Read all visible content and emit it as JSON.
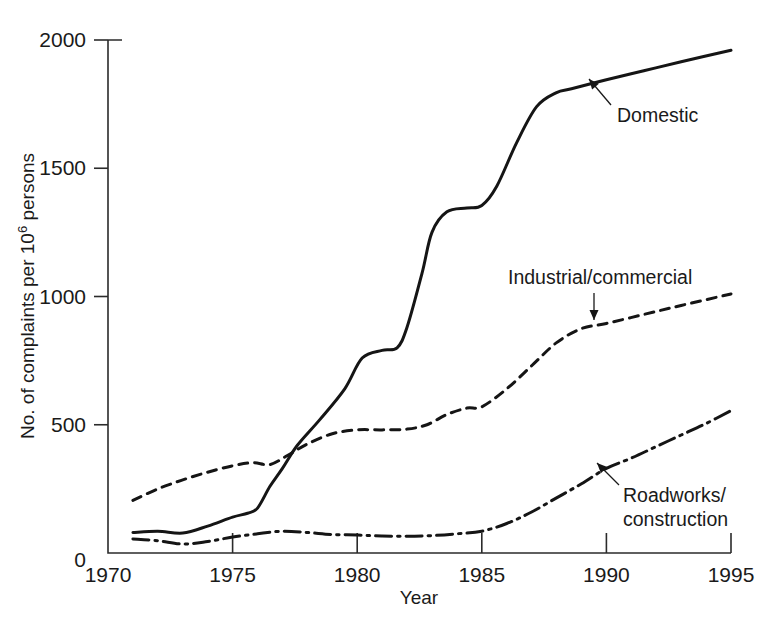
{
  "chart_data": {
    "type": "line",
    "title": "",
    "xlabel": "Year",
    "ylabel": "No. of complaints per 10^6 persons",
    "ylabel_prefix": "No. of complaints per 10",
    "ylabel_exponent": "6",
    "ylabel_suffix": " persons",
    "xlim": [
      1970,
      1995
    ],
    "ylim": [
      0,
      2000
    ],
    "xticks": [
      1970,
      1975,
      1980,
      1985,
      1990,
      1995
    ],
    "xtick_labels": [
      "1970",
      "1975",
      "1980",
      "1985",
      "1990",
      "1995"
    ],
    "yticks": [
      0,
      500,
      1000,
      1500,
      2000
    ],
    "ytick_labels": [
      "0",
      "500",
      "1000",
      "1500",
      "2000"
    ],
    "grid": false,
    "legend": "inline-annotations",
    "series": [
      {
        "name": "Domestic",
        "style": "solid",
        "x": [
          1971.0,
          1972.0,
          1973.0,
          1974.0,
          1975.0,
          1975.6,
          1976.0,
          1976.5,
          1977.0,
          1977.6,
          1978.5,
          1979.5,
          1980.2,
          1981.0,
          1981.6,
          1982.0,
          1982.6,
          1983.0,
          1983.6,
          1984.4,
          1985.0,
          1985.6,
          1986.4,
          1987.2,
          1988.0,
          1988.6,
          1990.0,
          1991.5,
          1993.0,
          1995.0
        ],
        "values": [
          80,
          85,
          78,
          105,
          140,
          155,
          175,
          260,
          330,
          420,
          520,
          640,
          760,
          790,
          800,
          880,
          1090,
          1250,
          1330,
          1345,
          1355,
          1430,
          1600,
          1740,
          1795,
          1810,
          1845,
          1880,
          1915,
          1960
        ]
      },
      {
        "name": "Industrial/commercial",
        "style": "dashed",
        "x": [
          1971.0,
          1972.0,
          1973.0,
          1974.0,
          1975.0,
          1975.8,
          1976.5,
          1977.2,
          1978.0,
          1979.0,
          1980.0,
          1981.0,
          1982.0,
          1982.8,
          1983.6,
          1984.4,
          1985.0,
          1986.0,
          1987.0,
          1988.0,
          1989.0,
          1990.0,
          1991.5,
          1993.0,
          1995.0
        ],
        "values": [
          205,
          250,
          285,
          315,
          340,
          352,
          345,
          380,
          425,
          465,
          480,
          480,
          483,
          500,
          540,
          565,
          570,
          640,
          730,
          820,
          875,
          895,
          930,
          965,
          1010
        ]
      },
      {
        "name": "Roadworks/construction",
        "style": "dashdot",
        "x": [
          1971.0,
          1972.0,
          1973.0,
          1974.0,
          1975.0,
          1976.0,
          1977.0,
          1978.0,
          1979.0,
          1980.0,
          1981.0,
          1982.0,
          1983.0,
          1984.0,
          1985.0,
          1986.0,
          1987.0,
          1988.0,
          1989.0,
          1990.0,
          1991.0,
          1992.0,
          1993.0,
          1994.0,
          1995.0
        ],
        "values": [
          55,
          48,
          35,
          45,
          62,
          75,
          85,
          80,
          72,
          70,
          66,
          65,
          68,
          75,
          85,
          115,
          160,
          215,
          270,
          330,
          370,
          415,
          460,
          505,
          555
        ]
      }
    ],
    "annotations": [
      {
        "text": "Domestic",
        "lines": [
          "Domestic"
        ],
        "label_x": 617,
        "label_y": 122,
        "arrow_from_x": 611,
        "arrow_from_y": 105,
        "arrow_to_x": 589,
        "arrow_to_y": 79
      },
      {
        "text": "Industrial/commercial",
        "lines": [
          "Industrial/commercial"
        ],
        "label_x": 508,
        "label_y": 284,
        "arrow_from_x": 594,
        "arrow_from_y": 293,
        "arrow_to_x": 594,
        "arrow_to_y": 320
      },
      {
        "text": "Roadworks/construction",
        "lines": [
          "Roadworks/",
          "construction"
        ],
        "label_x": 623,
        "label_y": 502,
        "arrow_from_x": 619,
        "arrow_from_y": 485,
        "arrow_to_x": 597,
        "arrow_to_y": 463
      }
    ]
  },
  "geometry": {
    "plot_left": 108,
    "plot_right": 731,
    "plot_top": 40,
    "plot_bottom": 553
  },
  "colors": {
    "ink": "#151515",
    "background": "#ffffff"
  }
}
